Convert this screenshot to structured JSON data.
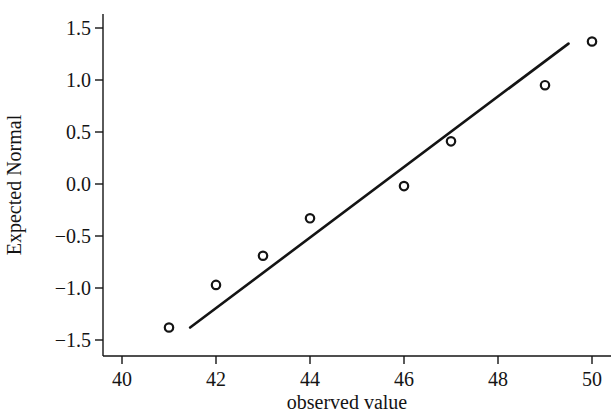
{
  "chart_data": {
    "type": "scatter",
    "title": "",
    "xlabel": "observed value",
    "ylabel": "Expected Normal",
    "xlim": [
      39.6,
      50.2
    ],
    "ylim": [
      -1.62,
      1.64
    ],
    "xticks": [
      "40",
      "42",
      "44",
      "46",
      "48",
      "50"
    ],
    "xtick_values": [
      40,
      42,
      44,
      46,
      48,
      50
    ],
    "yticks": [
      "1.5",
      "1.0",
      "0.5",
      "0.0",
      "−0.5",
      "−1.0",
      "−1.5"
    ],
    "ytick_values": [
      1.5,
      1.0,
      0.5,
      0.0,
      -0.5,
      -1.0,
      -1.5
    ],
    "grid": false,
    "legend": "none",
    "marker": "open-circle",
    "marker_color": "#141414",
    "line_color": "#141414",
    "points": [
      {
        "x": 41,
        "y": -1.38
      },
      {
        "x": 42,
        "y": -0.97
      },
      {
        "x": 43,
        "y": -0.69
      },
      {
        "x": 44,
        "y": -0.33
      },
      {
        "x": 46,
        "y": -0.02
      },
      {
        "x": 47,
        "y": 0.41
      },
      {
        "x": 49,
        "y": 0.95
      },
      {
        "x": 50,
        "y": 1.37
      }
    ],
    "reference_line": {
      "x_start": 41.45,
      "y_start": -1.38,
      "x_end": 49.5,
      "y_end": 1.35
    }
  },
  "axes": {
    "x_axis_color": "#141414",
    "y_axis_color": "#141414"
  }
}
